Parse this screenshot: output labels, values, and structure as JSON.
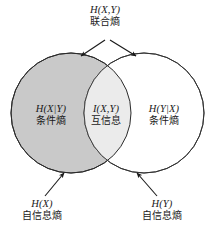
{
  "diagram": {
    "type": "venn",
    "title_label": {
      "math": "H(X,Y)",
      "cjk": "联合熵",
      "meaning": "joint-entropy"
    },
    "regions": [
      {
        "id": "left-only",
        "math": "H(X|Y)",
        "cjk": "条件熵",
        "meaning": "conditional-entropy-x-given-y",
        "fill": "#c9c9c9"
      },
      {
        "id": "intersection",
        "math": "I(X,Y)",
        "cjk": "互信息",
        "meaning": "mutual-information",
        "fill": "#ebebeb"
      },
      {
        "id": "right-only",
        "math": "H(Y|X)",
        "cjk": "条件熵",
        "meaning": "conditional-entropy-y-given-x",
        "fill": "#ffffff"
      }
    ],
    "callouts": [
      {
        "id": "left-circle",
        "math": "H(X)",
        "cjk": "自信息熵",
        "meaning": "self-information-entropy-x"
      },
      {
        "id": "right-circle",
        "math": "H(Y)",
        "cjk": "自信息熵",
        "meaning": "self-information-entropy-y"
      }
    ],
    "colors": {
      "left_circle_fill": "#c9c9c9",
      "right_circle_fill": "#ffffff",
      "overlap_fill": "#ebebeb",
      "stroke": "#2b2b2b",
      "arrow": "#1a1a1a",
      "background": "#ffffff"
    },
    "geometry": {
      "left_circle": {
        "cx": 71,
        "cy": 113,
        "r": 60
      },
      "right_circle": {
        "cx": 144,
        "cy": 113,
        "r": 60
      }
    }
  }
}
